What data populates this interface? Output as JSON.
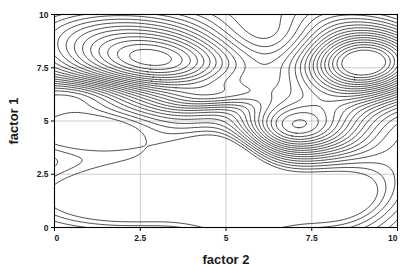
{
  "figure": {
    "type": "contour-plot",
    "background_color": "#ffffff",
    "line_color": "#000000",
    "grid_color": "#9a9a9a",
    "width": 417,
    "height": 275
  },
  "axes": {
    "x_title": "factor 2",
    "y_title": "factor 1",
    "x_ticks": [
      "0",
      "2.5",
      "5",
      "7.5",
      "10"
    ],
    "y_ticks": [
      "0",
      "2.5",
      "5",
      "7.5",
      "10"
    ]
  },
  "chart_data": {
    "type": "contour",
    "title": "",
    "xlabel": "factor 2",
    "ylabel": "factor 1",
    "xlim": [
      0,
      10
    ],
    "ylim": [
      0,
      10
    ],
    "xticks": [
      0,
      2.5,
      5,
      7.5,
      10
    ],
    "yticks": [
      0,
      2.5,
      5,
      7.5,
      10
    ],
    "xticklabels": [
      "0",
      "2.5",
      "5",
      "7.5",
      "10"
    ],
    "yticklabels": [
      "0",
      "2.5",
      "5",
      "7.5",
      "10"
    ],
    "grid": true,
    "legend": false,
    "filled": false,
    "n_levels": 26,
    "level_min": 0.06,
    "level_max": 1.58,
    "level_step": 0.0608,
    "features": {
      "maxima": [
        {
          "x": 3.0,
          "y": 7.8,
          "relative_height": 1.0,
          "note": "broad elliptical peak, ~9 nested rings"
        },
        {
          "x": 9.0,
          "y": 7.7,
          "relative_height": 1.3,
          "note": "sharpest peak, 13+ tightly packed nested rings"
        },
        {
          "x": 6.9,
          "y": 4.7,
          "relative_height": 0.78,
          "note": "rounded peak, ~5 nested rings"
        },
        {
          "x": 4.8,
          "y": 6.15,
          "relative_height": 0.34,
          "note": "small sliver-shaped closed contour"
        }
      ],
      "minima": [
        {
          "x": 2.3,
          "y": 1.6,
          "relative_depth": 0.62,
          "note": "large lens-shaped closed basin"
        },
        {
          "x": 8.25,
          "y": 1.5,
          "relative_depth": 0.55,
          "note": "rounded closed basin lower right"
        },
        {
          "x": 1.2,
          "y": 4.55,
          "relative_depth": 0.48,
          "note": "elongated basin exiting left edge"
        },
        {
          "x": 0.7,
          "y": 6.2,
          "relative_depth": 0.3,
          "note": "narrow basin exiting left edge"
        },
        {
          "x": 4.5,
          "y": 3.45,
          "relative_depth": 0.22,
          "note": "small irregular closed blob"
        }
      ],
      "saddles": [
        {
          "x": 5.3,
          "y": 8.6,
          "note": "ridge bends between left and right peaks"
        },
        {
          "x": 5.6,
          "y": 2.2,
          "note": "steep near-vertical contour bundle"
        }
      ]
    },
    "field_model": {
      "note": "Scalar field reconstructed as a sum of anisotropic Gaussian bumps; contour lines are extracted by marching squares at evenly spaced levels.",
      "base": 0.42,
      "components": [
        {
          "amp": 0.95,
          "cx": 3.0,
          "cy": 7.8,
          "sx": 1.85,
          "sy": 1.05,
          "rot": -0.1
        },
        {
          "amp": 1.3,
          "cx": 9.05,
          "cy": 7.7,
          "sx": 1.35,
          "sy": 1.2,
          "rot": 0.15
        },
        {
          "amp": 0.72,
          "cx": 6.9,
          "cy": 4.7,
          "sx": 1.3,
          "sy": 0.95,
          "rot": 0.05
        },
        {
          "amp": 0.26,
          "cx": 4.8,
          "cy": 6.15,
          "sx": 1.05,
          "sy": 0.42,
          "rot": 0.18
        },
        {
          "amp": 0.3,
          "cx": 2.0,
          "cy": 9.6,
          "sx": 2.2,
          "sy": 0.95,
          "rot": 0.0
        },
        {
          "amp": 0.22,
          "cx": 7.6,
          "cy": 9.9,
          "sx": 1.6,
          "sy": 0.9,
          "rot": 0.0
        },
        {
          "amp": -0.66,
          "cx": 2.3,
          "cy": 1.55,
          "sx": 2.3,
          "sy": 1.15,
          "rot": 0.05
        },
        {
          "amp": -0.58,
          "cx": 8.3,
          "cy": 1.45,
          "sx": 1.45,
          "sy": 1.25,
          "rot": -0.05
        },
        {
          "amp": -0.5,
          "cx": 0.9,
          "cy": 4.55,
          "sx": 1.7,
          "sy": 0.8,
          "rot": 0.0
        },
        {
          "amp": -0.34,
          "cx": 0.4,
          "cy": 6.25,
          "sx": 1.3,
          "sy": 0.55,
          "rot": 0.0
        },
        {
          "amp": -0.3,
          "cx": 4.45,
          "cy": 3.45,
          "sx": 1.1,
          "sy": 0.8,
          "rot": 0.1
        },
        {
          "amp": -0.4,
          "cx": 5.45,
          "cy": 1.1,
          "sx": 1.1,
          "sy": 1.6,
          "rot": 0.0
        },
        {
          "amp": -0.3,
          "cx": 5.2,
          "cy": 4.4,
          "sx": 0.85,
          "sy": 1.4,
          "rot": 0.0
        },
        {
          "amp": -0.22,
          "cx": 10.3,
          "cy": 4.7,
          "sx": 1.1,
          "sy": 1.5,
          "rot": 0.0
        },
        {
          "amp": -0.18,
          "cx": 6.2,
          "cy": 9.3,
          "sx": 1.1,
          "sy": 1.0,
          "rot": 0.0
        },
        {
          "amp": 0.16,
          "cx": 10.4,
          "cy": 0.6,
          "sx": 1.4,
          "sy": 1.3,
          "rot": 0.0
        },
        {
          "amp": 0.14,
          "cx": 0.2,
          "cy": 8.6,
          "sx": 1.5,
          "sy": 1.1,
          "rot": 0.0
        }
      ]
    }
  }
}
